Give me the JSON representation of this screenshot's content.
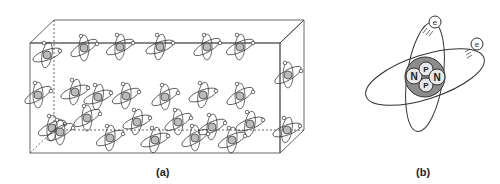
{
  "panels": [
    {
      "id": "a",
      "caption": "(a)",
      "description": "Box of randomly oriented atoms, each drawn as a nucleus with an elliptical electron orbit",
      "atom_positions": [
        [
          47,
          55,
          -20
        ],
        [
          84,
          48,
          -30
        ],
        [
          120,
          47,
          -25
        ],
        [
          160,
          47,
          -20
        ],
        [
          207,
          47,
          -30
        ],
        [
          240,
          47,
          -25
        ],
        [
          38,
          95,
          -30
        ],
        [
          75,
          92,
          -20
        ],
        [
          126,
          96,
          -25
        ],
        [
          165,
          97,
          -30
        ],
        [
          203,
          95,
          -20
        ],
        [
          240,
          96,
          -30
        ],
        [
          52,
          128,
          -25
        ],
        [
          87,
          118,
          -30
        ],
        [
          98,
          97,
          -20
        ],
        [
          137,
          122,
          -20
        ],
        [
          178,
          122,
          -30
        ],
        [
          212,
          127,
          -25
        ],
        [
          250,
          124,
          -20
        ],
        [
          60,
          132,
          -30
        ],
        [
          110,
          138,
          -25
        ],
        [
          155,
          140,
          -20
        ],
        [
          195,
          138,
          -30
        ],
        [
          232,
          140,
          -25
        ],
        [
          287,
          130,
          -20
        ],
        [
          288,
          75,
          -30
        ]
      ]
    },
    {
      "id": "b",
      "caption": "(b)",
      "description": "Single atom: nucleus with protons and neutrons, two electron orbits",
      "nucleus_labels": [
        "N",
        "P",
        "P",
        "N"
      ],
      "electron_label": "e",
      "electrons": 2
    }
  ],
  "colors": {
    "line": "#333333",
    "nucleus_fill": "#8c8c8c",
    "particle_fill": "#e8e8e8",
    "caption": "#222222"
  }
}
